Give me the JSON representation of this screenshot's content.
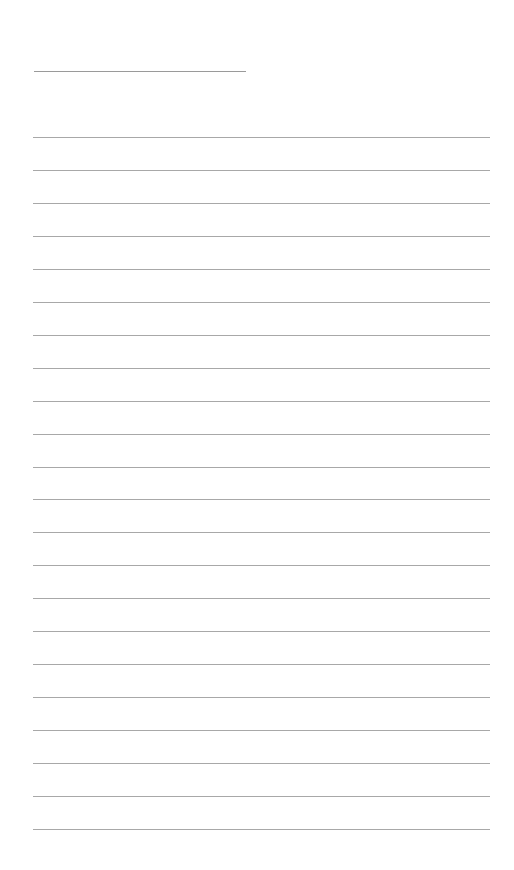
{
  "page": {
    "type": "lined-paper",
    "background_color": "#ffffff",
    "line_color": "#a8a8a8",
    "header_line": {
      "x": 34,
      "y": 71,
      "width": 212
    },
    "rules": {
      "count": 22,
      "x": 33,
      "width": 457,
      "first_y": 137,
      "spacing": 32.95
    }
  }
}
